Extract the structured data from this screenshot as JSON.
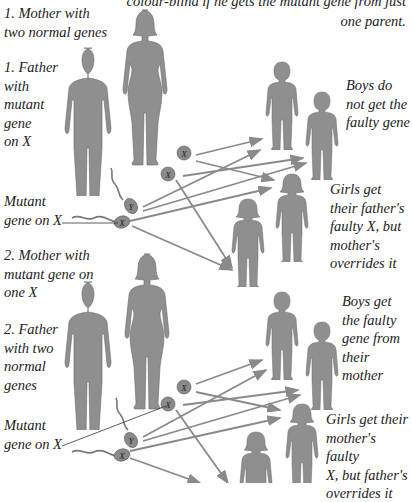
{
  "caption": {
    "line1": "colour-blind if he gets the mutant gene from just",
    "line2": "one parent."
  },
  "scenario1": {
    "mother_label": "1. Mother with\ntwo normal genes",
    "father_label": "1. Father\nwith\nmutant\ngene\non X",
    "mutant_label": "Mutant\ngene on X",
    "boys_label": "Boys do\nnot get the\nfaulty gene",
    "girls_label": "Girls get\ntheir father's\nfaulty X, but\nmother's\noverrides it",
    "egg_labels": [
      "X",
      "X"
    ],
    "sperm_labels": [
      "Y",
      "X"
    ]
  },
  "scenario2": {
    "mother_label": "2. Mother with\nmutant gene on\none X",
    "father_label": "2. Father\nwith two\nnormal\ngenes",
    "mutant_label": "Mutant\ngene on X",
    "boys_label": "Boys get\nthe faulty\ngene from\ntheir\nmother",
    "girls_label": "Girls get their\nmother's faulty\nX, but father's\noverrides it",
    "egg_labels": [
      "X",
      "X"
    ],
    "sperm_labels": [
      "Y",
      "X"
    ]
  },
  "colors": {
    "figure": "#8f8f8f",
    "figure_outline": "#6a6a6a",
    "arrow": "#8a8a8a",
    "text": "#222222"
  }
}
